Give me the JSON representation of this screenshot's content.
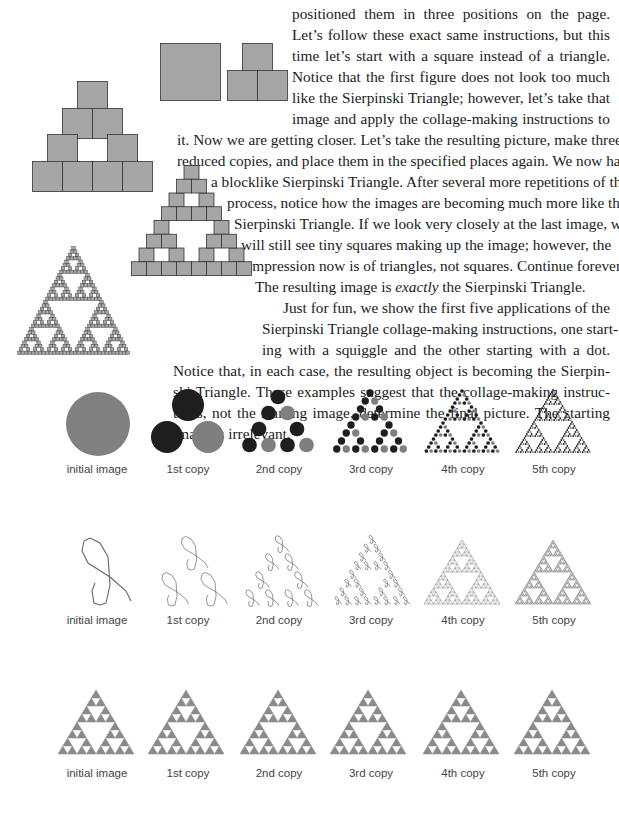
{
  "body_text": {
    "lines": [
      "positioned them in three positions on the page.",
      "Let’s follow these exact same instructions, but this",
      "time let’s start with a square instead of a triangle.",
      "Notice that the first figure does not look too much",
      "like the Sierpinski Triangle; however, let’s take that",
      "image and apply the collage-making instructions to",
      "it. Now we are getting closer. Let’s take the resulting picture, make three",
      "reduced copies, and place them in the specified places again. We now have",
      "a blocklike Sierpinski Triangle. After several more repetitions of this",
      "process, notice how the images are becoming much more like the",
      "Sierpinski Triangle. If we look very closely at the last image, we",
      "will still see tiny squares making up the image; however, the",
      "impression now is of triangles, not squares. Continue forever.",
      "The resulting image is",
      "exactly",
      "the Sierpinski Triangle.",
      "Just for fun, we show the first five applications of the",
      "Sierpinski Triangle collage-making instructions, one start-",
      "ing with a squiggle and the other starting with a dot.",
      "Notice that, in each case, the resulting object is becoming the Sierpin-",
      "ski Triangle. These examples suggest that the collage-making instruc-",
      "tions, not the starting image, determine the final picture. The starting",
      "image is irrelevant."
    ]
  },
  "figures": {
    "square_sequence": [
      "square",
      "3 squares",
      "9 squares",
      "27 squares",
      "sierpinski of squares"
    ],
    "rows": [
      {
        "name": "dot",
        "captions": [
          "initial image",
          "1st copy",
          "2nd copy",
          "3rd copy",
          "4th copy",
          "5th copy"
        ]
      },
      {
        "name": "squiggle",
        "captions": [
          "initial image",
          "1st copy",
          "2nd copy",
          "3rd copy",
          "4th copy",
          "5th copy"
        ]
      },
      {
        "name": "triangle",
        "captions": [
          "initial image",
          "1st copy",
          "2nd copy",
          "3rd copy",
          "4th copy",
          "5th copy"
        ]
      }
    ]
  },
  "colors": {
    "square_fill": "#a6a6a6",
    "dark_dot": "#1e1e1e",
    "gray_dot": "#7f7f7f",
    "big_dot": "#808080",
    "triangle_gray": "#8a8a8a"
  }
}
